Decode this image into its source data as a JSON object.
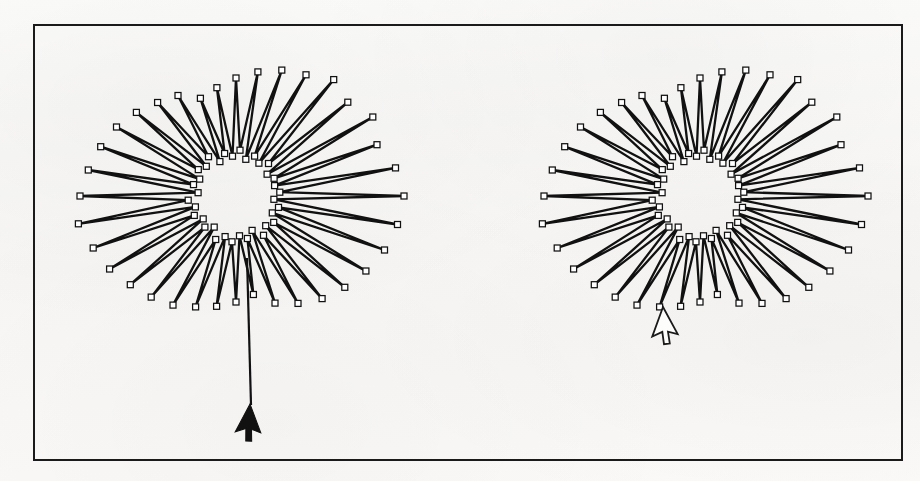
{
  "document": {
    "title": "Radial star-burst polyline figure pair",
    "media": "scanned-page",
    "background_color": "#fbfbfa",
    "ink_color": "#111111"
  },
  "frame": {
    "name": "figure-border",
    "x": 34,
    "y": 25,
    "width": 868,
    "height": 435,
    "stroke_color": "#1a1a1a",
    "stroke_width": 2
  },
  "figures": [
    {
      "id": "left-plot",
      "label": "left radial star plot",
      "center": {
        "x": 236,
        "y": 196
      },
      "cursor": {
        "type": "filled-arrow",
        "x": 250,
        "y": 404,
        "color": "#111111"
      },
      "leader_line": {
        "from": {
          "x": 247,
          "y": 258
        },
        "to": {
          "x": 251,
          "y": 405
        }
      }
    },
    {
      "id": "right-plot",
      "label": "right radial star plot",
      "center": {
        "x": 700,
        "y": 196
      },
      "cursor": {
        "type": "hollow-arrow",
        "x": 663,
        "y": 307,
        "color": "#fdfdfc"
      },
      "leader_line": null
    }
  ],
  "chart_data": {
    "type": "line",
    "subtype": "radial-zigzag-starburst",
    "title": "",
    "xlabel": "",
    "ylabel": "",
    "grid": false,
    "legend": null,
    "axes_visible": false,
    "marker": {
      "shape": "open-square",
      "size_px": 6,
      "fill": "#ffffff",
      "edge": "#111111"
    },
    "line": {
      "color": "#111111",
      "width_px": 2.3
    },
    "n_spokes": 36,
    "inner_radius": 30,
    "angles_deg": [
      0,
      5,
      10,
      15,
      20,
      25,
      30,
      35,
      40,
      45,
      50,
      55,
      60,
      65,
      70,
      75,
      80,
      85,
      90,
      95,
      100,
      105,
      110,
      115,
      120,
      125,
      130,
      135,
      140,
      145,
      150,
      155,
      160,
      165,
      170,
      175,
      180,
      185,
      190,
      195,
      200,
      205,
      210,
      215,
      220,
      225,
      230,
      235,
      240,
      245,
      250,
      255,
      260,
      265,
      270,
      275,
      280,
      285,
      290,
      295,
      300,
      305,
      310,
      315,
      320,
      325,
      330,
      335,
      340,
      345,
      350,
      355
    ],
    "radii_px": [
      168,
      44,
      162,
      40,
      150,
      42,
      158,
      38,
      146,
      46,
      152,
      40,
      140,
      44,
      134,
      38,
      126,
      46,
      118,
      40,
      110,
      44,
      104,
      38,
      116,
      48,
      122,
      42,
      130,
      46,
      138,
      40,
      144,
      44,
      150,
      38,
      156,
      48,
      160,
      42,
      152,
      46,
      146,
      40,
      138,
      44,
      132,
      38,
      126,
      48,
      118,
      42,
      112,
      46,
      106,
      40,
      100,
      44,
      114,
      38,
      124,
      48,
      134,
      42,
      142,
      46,
      150,
      40,
      158,
      44,
      164,
      38
    ],
    "series": [
      {
        "name": "left-plot",
        "values_are": "radii_px"
      },
      {
        "name": "right-plot",
        "values_are": "radii_px"
      }
    ]
  }
}
